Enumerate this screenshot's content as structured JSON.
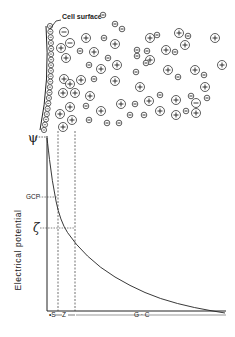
{
  "labels": {
    "cell_surface": "Cell surface",
    "y_axis": "Electrical potential",
    "gcp": "GCP",
    "zeta": "ζ",
    "psi": "ψ",
    "s": "S",
    "z": "Z",
    "gc": "G · C"
  },
  "colors": {
    "ink": "#222222",
    "background": "#ffffff"
  },
  "ions": [
    {
      "x": 64,
      "y": 32,
      "r": 4.5,
      "sign": "-"
    },
    {
      "x": 70,
      "y": 43,
      "r": 4.5,
      "sign": "-"
    },
    {
      "x": 61,
      "y": 48,
      "r": 4.5,
      "sign": "+"
    },
    {
      "x": 66,
      "y": 58,
      "r": 4.5,
      "sign": "+"
    },
    {
      "x": 86,
      "y": 38,
      "r": 4.5,
      "sign": "+"
    },
    {
      "x": 80,
      "y": 51,
      "r": 2.8,
      "sign": "-"
    },
    {
      "x": 94,
      "y": 52,
      "r": 4.5,
      "sign": "+"
    },
    {
      "x": 104,
      "y": 38,
      "r": 2.8,
      "sign": "-"
    },
    {
      "x": 115,
      "y": 44,
      "r": 4.5,
      "sign": "+"
    },
    {
      "x": 108,
      "y": 58,
      "r": 2.8,
      "sign": "-"
    },
    {
      "x": 89,
      "y": 65,
      "r": 2.8,
      "sign": "-"
    },
    {
      "x": 101,
      "y": 69,
      "r": 4.5,
      "sign": "+"
    },
    {
      "x": 64,
      "y": 79,
      "r": 4.5,
      "sign": "+"
    },
    {
      "x": 70,
      "y": 84,
      "r": 4.5,
      "sign": "+"
    },
    {
      "x": 81,
      "y": 80,
      "r": 4.5,
      "sign": "+"
    },
    {
      "x": 94,
      "y": 79,
      "r": 2.8,
      "sign": "-"
    },
    {
      "x": 115,
      "y": 81,
      "r": 4.5,
      "sign": "+"
    },
    {
      "x": 63,
      "y": 93,
      "r": 4.5,
      "sign": "+"
    },
    {
      "x": 75,
      "y": 93,
      "r": 4.5,
      "sign": "+"
    },
    {
      "x": 90,
      "y": 96,
      "r": 4.5,
      "sign": "+"
    },
    {
      "x": 70,
      "y": 107,
      "r": 4.5,
      "sign": "+"
    },
    {
      "x": 86,
      "y": 106,
      "r": 2.8,
      "sign": "-"
    },
    {
      "x": 101,
      "y": 111,
      "r": 4.5,
      "sign": "+"
    },
    {
      "x": 60,
      "y": 114,
      "r": 4.5,
      "sign": "+"
    },
    {
      "x": 72,
      "y": 120,
      "r": 4.5,
      "sign": "+"
    },
    {
      "x": 89,
      "y": 120,
      "r": 2.8,
      "sign": "-"
    },
    {
      "x": 63,
      "y": 127,
      "r": 4.5,
      "sign": "+"
    },
    {
      "x": 107,
      "y": 123,
      "r": 2.8,
      "sign": "-"
    },
    {
      "x": 119,
      "y": 123,
      "r": 2.8,
      "sign": "-"
    },
    {
      "x": 130,
      "y": 115,
      "r": 2.8,
      "sign": "-"
    },
    {
      "x": 135,
      "y": 104,
      "r": 2.8,
      "sign": "-"
    },
    {
      "x": 121,
      "y": 104,
      "r": 4.5,
      "sign": "+"
    },
    {
      "x": 140,
      "y": 87,
      "r": 4.5,
      "sign": "+"
    },
    {
      "x": 136,
      "y": 72,
      "r": 2.8,
      "sign": "-"
    },
    {
      "x": 150,
      "y": 60,
      "r": 4.5,
      "sign": "+"
    },
    {
      "x": 137,
      "y": 56,
      "r": 2.8,
      "sign": "-"
    },
    {
      "x": 115,
      "y": 24,
      "r": 2.8,
      "sign": "-"
    },
    {
      "x": 122,
      "y": 29,
      "r": 2.8,
      "sign": "-"
    },
    {
      "x": 146,
      "y": 63,
      "r": 2.8,
      "sign": "-"
    },
    {
      "x": 117,
      "y": 65,
      "r": 4.5,
      "sign": "+"
    },
    {
      "x": 150,
      "y": 38,
      "r": 4.5,
      "sign": "+"
    },
    {
      "x": 157,
      "y": 35,
      "r": 2.8,
      "sign": "-"
    },
    {
      "x": 137,
      "y": 50,
      "r": 2.8,
      "sign": "-"
    },
    {
      "x": 147,
      "y": 51,
      "r": 2.8,
      "sign": "-"
    },
    {
      "x": 166,
      "y": 50,
      "r": 4.5,
      "sign": "+"
    },
    {
      "x": 175,
      "y": 52,
      "r": 2.8,
      "sign": "-"
    },
    {
      "x": 179,
      "y": 33,
      "r": 4.5,
      "sign": "+"
    },
    {
      "x": 185,
      "y": 45,
      "r": 4.5,
      "sign": "+"
    },
    {
      "x": 188,
      "y": 36,
      "r": 2.8,
      "sign": "-"
    },
    {
      "x": 168,
      "y": 70,
      "r": 4.5,
      "sign": "+"
    },
    {
      "x": 178,
      "y": 77,
      "r": 2.8,
      "sign": "-"
    },
    {
      "x": 195,
      "y": 70,
      "r": 4.5,
      "sign": "+"
    },
    {
      "x": 204,
      "y": 75,
      "r": 2.8,
      "sign": "-"
    },
    {
      "x": 160,
      "y": 95,
      "r": 2.8,
      "sign": "-"
    },
    {
      "x": 176,
      "y": 100,
      "r": 4.5,
      "sign": "+"
    },
    {
      "x": 191,
      "y": 96,
      "r": 2.8,
      "sign": "-"
    },
    {
      "x": 205,
      "y": 87,
      "r": 4.5,
      "sign": "+"
    },
    {
      "x": 207,
      "y": 98,
      "r": 2.8,
      "sign": "-"
    },
    {
      "x": 196,
      "y": 103,
      "r": 4.5,
      "sign": "-"
    },
    {
      "x": 149,
      "y": 101,
      "r": 4.5,
      "sign": "+"
    },
    {
      "x": 160,
      "y": 111,
      "r": 4.5,
      "sign": "+"
    },
    {
      "x": 144,
      "y": 115,
      "r": 2.8,
      "sign": "-"
    },
    {
      "x": 176,
      "y": 115,
      "r": 4.5,
      "sign": "+"
    },
    {
      "x": 186,
      "y": 111,
      "r": 2.8,
      "sign": "-"
    },
    {
      "x": 196,
      "y": 113,
      "r": 4.5,
      "sign": "+"
    },
    {
      "x": 222,
      "y": 65,
      "r": 4.5,
      "sign": "+"
    },
    {
      "x": 215,
      "y": 38,
      "r": 4.5,
      "sign": "+"
    },
    {
      "x": 103,
      "y": 15,
      "r": 2.8,
      "sign": "-"
    }
  ],
  "chart": {
    "curve_points": [
      [
        47,
        138
      ],
      [
        52,
        181
      ],
      [
        60,
        221
      ],
      [
        75,
        244
      ],
      [
        100,
        268
      ],
      [
        130,
        286
      ],
      [
        160,
        299
      ],
      [
        195,
        308
      ],
      [
        225,
        313
      ]
    ]
  }
}
